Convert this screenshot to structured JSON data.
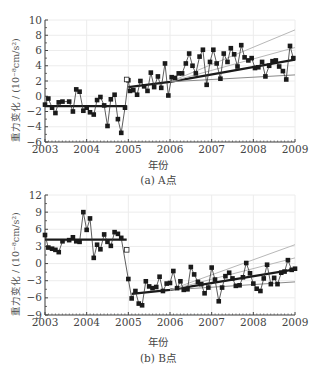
{
  "figure": {
    "panels": [
      {
        "id": "A",
        "caption": "(a) A点",
        "xlabel": "年份",
        "ylabel": "重力变化 / (10⁻⁸cm/s²)"
      },
      {
        "id": "B",
        "caption": "(b) B点",
        "xlabel": "年份",
        "ylabel": "重力变化 / (10⁻⁸cm/s²)"
      }
    ]
  },
  "chart_data": [
    {
      "type": "line",
      "title": "(a) A点",
      "xlabel": "年份",
      "ylabel": "重力变化 / (10⁻⁸cm/s²)",
      "xlim": [
        2003,
        2009
      ],
      "ylim": [
        -6,
        10
      ],
      "xticks": [
        2003,
        2004,
        2005,
        2006,
        2007,
        2008,
        2009
      ],
      "yticks": [
        -6,
        -4,
        -2,
        0,
        2,
        4,
        6,
        8,
        10
      ],
      "grid": true,
      "legend": "none",
      "series": [
        {
          "name": "monthly gravity change",
          "marker": "filled-square",
          "x": [
            2003.0,
            2003.08,
            2003.17,
            2003.25,
            2003.33,
            2003.42,
            2003.58,
            2003.67,
            2003.75,
            2003.83,
            2003.92,
            2004.0,
            2004.08,
            2004.17,
            2004.25,
            2004.33,
            2004.42,
            2004.5,
            2004.58,
            2004.67,
            2004.75,
            2004.83,
            2004.92,
            2005.0,
            2005.04,
            2005.12,
            2005.21,
            2005.29,
            2005.38,
            2005.46,
            2005.54,
            2005.62,
            2005.71,
            2005.79,
            2005.88,
            2005.96,
            2006.04,
            2006.12,
            2006.21,
            2006.29,
            2006.38,
            2006.46,
            2006.54,
            2006.62,
            2006.71,
            2006.79,
            2006.88,
            2006.96,
            2007.04,
            2007.12,
            2007.21,
            2007.29,
            2007.38,
            2007.46,
            2007.54,
            2007.62,
            2007.71,
            2007.79,
            2007.88,
            2007.96,
            2008.04,
            2008.12,
            2008.21,
            2008.29,
            2008.38,
            2008.46,
            2008.54,
            2008.62,
            2008.71,
            2008.79,
            2008.88,
            2008.96
          ],
          "y": [
            -1.1,
            -0.3,
            -1.5,
            -2.2,
            -0.8,
            -0.7,
            -0.7,
            -2.0,
            0.9,
            0.6,
            -1.9,
            -1.5,
            -2.1,
            -2.4,
            -0.5,
            -0.1,
            -1.2,
            -3.9,
            -0.4,
            0.2,
            -3.0,
            -4.8,
            -1.5,
            2.1,
            0.7,
            0.8,
            0.2,
            2.0,
            1.3,
            0.7,
            3.1,
            1.2,
            2.6,
            1.1,
            4.3,
            0.1,
            2.5,
            2.4,
            3.0,
            3.0,
            4.3,
            5.6,
            4.0,
            3.0,
            5.2,
            6.1,
            1.5,
            4.5,
            6.1,
            4.3,
            2.3,
            5.6,
            4.5,
            6.3,
            5.5,
            3.9,
            6.7,
            5.1,
            4.7,
            5.0,
            3.7,
            3.8,
            4.5,
            2.6,
            4.0,
            4.6,
            4.7,
            3.9,
            3.3,
            2.2,
            6.6,
            5.0
          ]
        },
        {
          "name": "reference point (open marker)",
          "marker": "open-square",
          "x": [
            2004.96
          ],
          "y": [
            2.2
          ]
        },
        {
          "name": "fit before 2005",
          "style": "thick-dark",
          "x": [
            2003.0,
            2004.96
          ],
          "y": [
            -1.3,
            -1.3
          ]
        },
        {
          "name": "fit after 2005",
          "style": "thick-dark",
          "x": [
            2005.0,
            2006.0,
            2009.0
          ],
          "y": [
            1.2,
            1.9,
            4.8
          ]
        },
        {
          "name": "upper bound 1",
          "style": "thin-light",
          "x": [
            2006.0,
            2009.0
          ],
          "y": [
            1.9,
            8.7
          ]
        },
        {
          "name": "upper bound 2",
          "style": "thin-light",
          "x": [
            2006.0,
            2009.0
          ],
          "y": [
            1.9,
            6.4
          ]
        },
        {
          "name": "lower bound",
          "style": "thin-mid",
          "x": [
            2006.0,
            2009.0
          ],
          "y": [
            1.9,
            2.8
          ]
        }
      ]
    },
    {
      "type": "line",
      "title": "(b) B点",
      "xlabel": "年份",
      "ylabel": "重力变化 / (10⁻⁸cm/s²)",
      "xlim": [
        2003,
        2009
      ],
      "ylim": [
        -9,
        12
      ],
      "xticks": [
        2003,
        2004,
        2005,
        2006,
        2007,
        2008,
        2009
      ],
      "yticks": [
        -9,
        -6,
        -3,
        0,
        3,
        6,
        9,
        12
      ],
      "grid": true,
      "legend": "none",
      "series": [
        {
          "name": "monthly gravity change",
          "marker": "filled-square",
          "x": [
            2003.0,
            2003.08,
            2003.17,
            2003.25,
            2003.33,
            2003.42,
            2003.58,
            2003.67,
            2003.75,
            2003.83,
            2003.92,
            2004.0,
            2004.08,
            2004.17,
            2004.25,
            2004.33,
            2004.42,
            2004.5,
            2004.58,
            2004.67,
            2004.75,
            2004.83,
            2005.0,
            2005.08,
            2005.17,
            2005.25,
            2005.33,
            2005.42,
            2005.5,
            2005.58,
            2005.67,
            2005.75,
            2005.83,
            2005.92,
            2006.0,
            2006.08,
            2006.17,
            2006.25,
            2006.33,
            2006.42,
            2006.5,
            2006.58,
            2006.67,
            2006.75,
            2006.83,
            2006.92,
            2007.0,
            2007.08,
            2007.17,
            2007.25,
            2007.33,
            2007.42,
            2007.5,
            2007.58,
            2007.67,
            2007.75,
            2007.83,
            2007.92,
            2008.0,
            2008.08,
            2008.17,
            2008.25,
            2008.33,
            2008.42,
            2008.5,
            2008.58,
            2008.67,
            2008.75,
            2008.83,
            2008.92,
            2009.0
          ],
          "y": [
            5.0,
            2.8,
            2.6,
            2.4,
            2.0,
            3.9,
            4.1,
            4.6,
            3.9,
            3.8,
            9.0,
            5.9,
            7.9,
            1.0,
            3.3,
            2.5,
            5.1,
            3.8,
            3.1,
            5.5,
            5.2,
            4.5,
            -2.7,
            -6.1,
            -4.8,
            -7.0,
            -7.3,
            -3.1,
            -4.0,
            -4.3,
            -4.1,
            -2.3,
            -4.8,
            -3.5,
            -3.4,
            -1.3,
            -4.3,
            -3.1,
            -4.6,
            -4.5,
            -0.6,
            -1.9,
            -3.2,
            -3.6,
            -5.2,
            -4.2,
            -0.7,
            -2.8,
            -6.6,
            -4.2,
            -2.2,
            -1.6,
            -2.6,
            -3.9,
            -3.8,
            -2.4,
            0.1,
            -1.7,
            -3.5,
            -4.4,
            -4.8,
            -2.6,
            -0.2,
            -3.6,
            -2.5,
            -3.6,
            -1.6,
            -1.4,
            0.6,
            -1.1,
            -0.9
          ]
        },
        {
          "name": "reference point (open marker)",
          "marker": "open-square",
          "x": [
            2004.96
          ],
          "y": [
            2.4
          ]
        },
        {
          "name": "fit before 2005",
          "style": "thick-dark",
          "x": [
            2003.0,
            2004.96
          ],
          "y": [
            4.2,
            4.2
          ]
        },
        {
          "name": "fit after 2005",
          "style": "thick-dark",
          "x": [
            2005.08,
            2006.0,
            2009.0
          ],
          "y": [
            -5.3,
            -4.6,
            -1.0
          ]
        },
        {
          "name": "upper bound 1",
          "style": "thin-light",
          "x": [
            2006.0,
            2009.0
          ],
          "y": [
            -4.6,
            3.3
          ]
        },
        {
          "name": "upper bound 2",
          "style": "thin-light",
          "x": [
            2006.0,
            2009.0
          ],
          "y": [
            -4.6,
            1.0
          ]
        },
        {
          "name": "lower bound",
          "style": "thin-mid",
          "x": [
            2006.0,
            2009.0
          ],
          "y": [
            -4.6,
            -3.2
          ]
        }
      ]
    }
  ]
}
